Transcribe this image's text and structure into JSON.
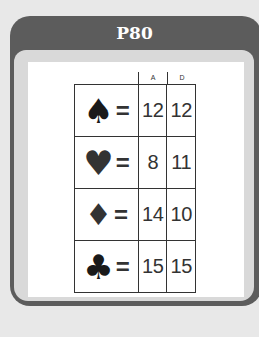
{
  "card": {
    "title": "P80",
    "colors": {
      "background": "#e8e8e8",
      "header": "#5c5c5c",
      "frame": "#d9d9d9",
      "body": "#ffffff"
    }
  },
  "table": {
    "columns": [
      "A",
      "D"
    ],
    "rows": [
      {
        "suit": "spade-icon",
        "glyph": "♠",
        "equals": "=",
        "A": "12",
        "D": "12"
      },
      {
        "suit": "heart-icon",
        "glyph": "♥",
        "equals": "=",
        "A": "8",
        "D": "11"
      },
      {
        "suit": "diamond-icon",
        "glyph": "♦",
        "equals": "=",
        "A": "14",
        "D": "10"
      },
      {
        "suit": "club-icon",
        "glyph": "♣",
        "equals": "=",
        "A": "15",
        "D": "15"
      }
    ]
  }
}
